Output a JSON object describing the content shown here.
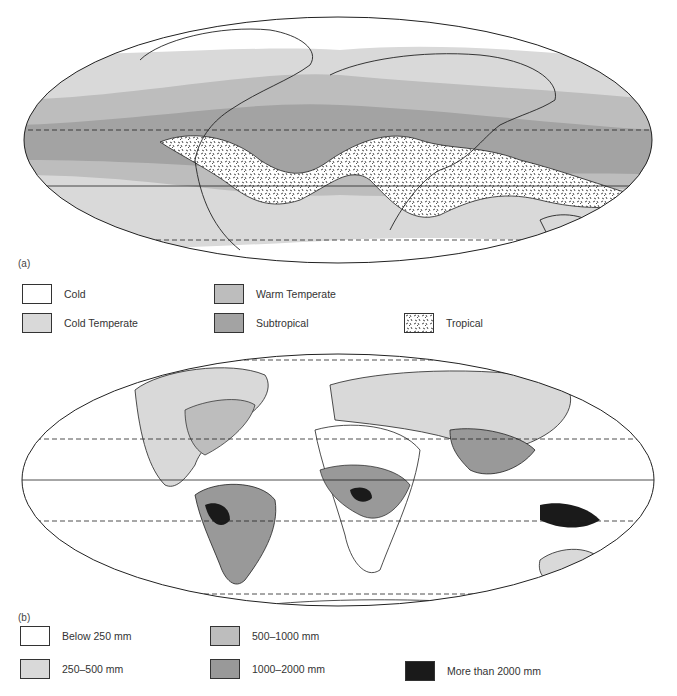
{
  "figure": {
    "panel_a": {
      "label": "(a)",
      "title": "Climate zones",
      "legend": [
        {
          "label": "Cold",
          "color": "#ffffff",
          "pattern": "none"
        },
        {
          "label": "Warm Temperate",
          "color": "#bdbdbd",
          "pattern": "none"
        },
        {
          "label": "Cold Temperate",
          "color": "#d9d9d9",
          "pattern": "none"
        },
        {
          "label": "Subtropical",
          "color": "#a3a3a3",
          "pattern": "none"
        },
        {
          "label": "Tropical",
          "color": "#ffffff",
          "pattern": "stipple"
        }
      ]
    },
    "panel_b": {
      "label": "(b)",
      "title": "Annual precipitation",
      "legend": [
        {
          "label": "Below 250 mm",
          "color": "#ffffff"
        },
        {
          "label": "500–1000 mm",
          "color": "#bdbdbd"
        },
        {
          "label": "250–500 mm",
          "color": "#d9d9d9"
        },
        {
          "label": "1000–2000 mm",
          "color": "#999999"
        },
        {
          "label": "More than 2000 mm",
          "color": "#1a1a1a"
        }
      ]
    }
  }
}
